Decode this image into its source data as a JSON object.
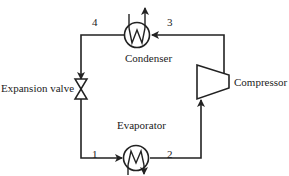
{
  "diagram": {
    "components": {
      "condenser": "Condenser",
      "evaporator": "Evaporator",
      "compressor": "Compressor",
      "expansion_valve": "Expansion valve"
    },
    "state_points": [
      "1",
      "2",
      "3",
      "4"
    ],
    "line_color": "#222222",
    "background": "#ffffff"
  }
}
